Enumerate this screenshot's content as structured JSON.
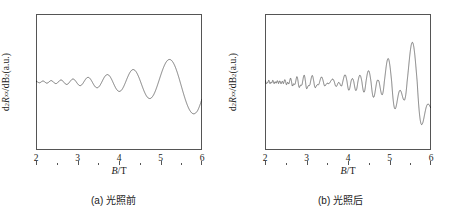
{
  "figure": {
    "panels": [
      {
        "id": "a",
        "caption": "(a) 光照前",
        "xlabel_var": "B",
        "xlabel_unit": "/T",
        "ylabel_prefix": "d",
        "ylabel_sup1": "2",
        "ylabel_var": "R",
        "ylabel_sub": "xx",
        "ylabel_mid": "/dB",
        "ylabel_sup2": "2",
        "ylabel_suffix": "(a.u.)",
        "xticks": [
          "2",
          "3",
          "4",
          "5",
          "6"
        ]
      },
      {
        "id": "b",
        "caption": "(b) 光照后",
        "xlabel_var": "B",
        "xlabel_unit": "/T",
        "ylabel_prefix": "d",
        "ylabel_sup1": "2",
        "ylabel_var": "R",
        "ylabel_sub": "xx",
        "ylabel_mid": "/dB",
        "ylabel_sup2": "2",
        "ylabel_suffix": "(a.u.)",
        "xticks": [
          "2",
          "3",
          "4",
          "5",
          "6"
        ]
      }
    ]
  },
  "chart_data": [
    {
      "type": "line",
      "panel": "a",
      "title": "(a) 光照前",
      "xlabel": "B/T",
      "ylabel": "d2Rxx/dB2 (a.u.)",
      "xlim": [
        2,
        6
      ],
      "ylim": [
        -1.15,
        1.15
      ],
      "xticks": [
        2,
        3,
        4,
        5,
        6
      ],
      "yticks": [],
      "grid": false,
      "legend": null,
      "series": [
        {
          "name": "d2Rxx/dB2 before illumination",
          "description": "Shubnikov-de Haas oscillation, periodic in 1/B, amplitude grows monotonically with B",
          "model": {
            "kind": "sdh_oscillation",
            "frequency_T": 26.0,
            "phase_rad": 0.0,
            "envelope": "exp(-alpha/B) amplitude growth",
            "alpha": 9.2,
            "amp_scale": 1.02,
            "beat_frequency_T": 0.0,
            "spin_split": false,
            "samples": 3000
          },
          "envelope_points": [
            {
              "B": 2.0,
              "amp": 0.01
            },
            {
              "B": 2.5,
              "amp": 0.027
            },
            {
              "B": 3.0,
              "amp": 0.055
            },
            {
              "B": 3.5,
              "amp": 0.098
            },
            {
              "B": 4.0,
              "amp": 0.155
            },
            {
              "B": 4.5,
              "amp": 0.23
            },
            {
              "B": 5.0,
              "amp": 0.325
            },
            {
              "B": 5.3,
              "amp": 0.395
            },
            {
              "B": 5.6,
              "amp": 0.47
            },
            {
              "B": 5.9,
              "amp": 0.56
            }
          ]
        }
      ]
    },
    {
      "type": "line",
      "panel": "b",
      "title": "(b) 光照后",
      "xlabel": "B/T",
      "ylabel": "d2Rxx/dB2 (a.u.)",
      "xlim": [
        2,
        6
      ],
      "ylim": [
        -1.15,
        1.15
      ],
      "xticks": [
        2,
        3,
        4,
        5,
        6
      ],
      "yticks": [],
      "grid": false,
      "legend": null,
      "series": [
        {
          "name": "d2Rxx/dB2 after illumination",
          "description": "Higher-frequency Shubnikov-de Haas oscillation with a beating node near B=3.6 T and spin-split (doubled) peaks at high field; negative excursions larger than positive",
          "model": {
            "kind": "sdh_oscillation",
            "frequency_T": 47.0,
            "phase_rad": 0.0,
            "envelope": "exp(-alpha/B) growth modulated by beating",
            "alpha": 11.5,
            "amp_scale": 1.35,
            "beat_frequency_T": 2.6,
            "beat_node_B": 3.6,
            "spin_split": true,
            "asymmetry": 1.45,
            "samples": 4000
          },
          "envelope_points": [
            {
              "B": 2.0,
              "amp": 0.018
            },
            {
              "B": 2.5,
              "amp": 0.048
            },
            {
              "B": 3.0,
              "amp": 0.08
            },
            {
              "B": 3.4,
              "amp": 0.06
            },
            {
              "B": 3.6,
              "amp": 0.035
            },
            {
              "B": 3.9,
              "amp": 0.14
            },
            {
              "B": 4.2,
              "amp": 0.23
            },
            {
              "B": 4.6,
              "amp": 0.32
            },
            {
              "B": 5.0,
              "amp": 0.41
            },
            {
              "B": 5.4,
              "amp": 0.5
            },
            {
              "B": 5.8,
              "amp": 0.58
            },
            {
              "B": 6.0,
              "amp": 0.62
            }
          ]
        }
      ]
    }
  ]
}
